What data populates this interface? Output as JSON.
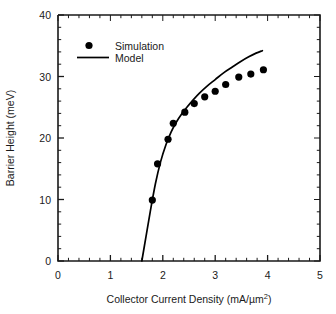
{
  "chart_data": {
    "type": "scatter",
    "title": "",
    "xlabel": "Collector Current Density (mA/µm²)",
    "ylabel": "Barrier Height (meV)",
    "xlim": [
      0,
      5
    ],
    "ylim": [
      0,
      40
    ],
    "xticks": [
      0,
      1,
      2,
      3,
      4,
      5
    ],
    "xticklabels": [
      "0",
      "1",
      "2",
      "3",
      "4",
      "5"
    ],
    "yticks": [
      0,
      10,
      20,
      30,
      40
    ],
    "yticklabels": [
      "0",
      "10",
      "20",
      "30",
      "40"
    ],
    "minor_tick_count_x": 5,
    "minor_tick_count_y": 5,
    "grid": false,
    "legend_position": "upper-left-inside",
    "series": [
      {
        "name": "Simulation",
        "style": "markers",
        "marker": "circle",
        "color": "#000000",
        "points": [
          [
            1.8,
            9.9
          ],
          [
            1.9,
            15.8
          ],
          [
            2.1,
            19.8
          ],
          [
            2.2,
            22.4
          ],
          [
            2.42,
            24.2
          ],
          [
            2.6,
            25.6
          ],
          [
            2.8,
            26.7
          ],
          [
            3.0,
            27.6
          ],
          [
            3.2,
            28.7
          ],
          [
            3.45,
            29.9
          ],
          [
            3.68,
            30.4
          ],
          [
            3.92,
            31.1
          ]
        ]
      },
      {
        "name": "Model",
        "style": "line",
        "color": "#000000",
        "points": [
          [
            1.6,
            0.0
          ],
          [
            1.68,
            4.0
          ],
          [
            1.76,
            8.0
          ],
          [
            1.86,
            12.6
          ],
          [
            1.96,
            16.2
          ],
          [
            2.06,
            18.9
          ],
          [
            2.16,
            21.0
          ],
          [
            2.26,
            22.6
          ],
          [
            2.36,
            23.9
          ],
          [
            2.46,
            25.0
          ],
          [
            2.58,
            26.2
          ],
          [
            2.7,
            27.3
          ],
          [
            2.84,
            28.4
          ],
          [
            3.0,
            29.5
          ],
          [
            3.16,
            30.6
          ],
          [
            3.32,
            31.5
          ],
          [
            3.48,
            32.4
          ],
          [
            3.64,
            33.2
          ],
          [
            3.78,
            33.8
          ],
          [
            3.9,
            34.2
          ]
        ]
      }
    ]
  },
  "axes": {
    "x_label_main": "Collector Current Density (mA/µm",
    "x_label_sup": "2",
    "x_label_close": ")",
    "y_label": "Barrier Height (meV)"
  },
  "legend": {
    "simulation_label": "Simulation",
    "model_label": "Model"
  },
  "colors": {
    "axis": "#1a1a1a",
    "marker": "#000000",
    "line": "#000000",
    "background": "#ffffff"
  }
}
